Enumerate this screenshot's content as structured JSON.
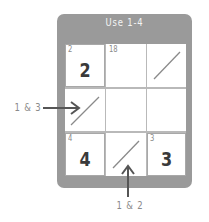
{
  "puzzle": {
    "title": "Use 1-4",
    "cells": [
      {
        "row": 0,
        "col": 0,
        "cage_label": "2",
        "value": "2",
        "slash": false
      },
      {
        "row": 0,
        "col": 1,
        "cage_label": "18",
        "value": "",
        "slash": false
      },
      {
        "row": 0,
        "col": 2,
        "cage_label": "",
        "value": "",
        "slash": true
      },
      {
        "row": 1,
        "col": 0,
        "cage_label": "",
        "value": "",
        "slash": true
      },
      {
        "row": 1,
        "col": 1,
        "cage_label": "",
        "value": "",
        "slash": false
      },
      {
        "row": 1,
        "col": 2,
        "cage_label": "",
        "value": "",
        "slash": false
      },
      {
        "row": 2,
        "col": 0,
        "cage_label": "4",
        "value": "4",
        "slash": false
      },
      {
        "row": 2,
        "col": 1,
        "cage_label": "",
        "value": "",
        "slash": true
      },
      {
        "row": 2,
        "col": 2,
        "cage_label": "3",
        "value": "3",
        "slash": false
      }
    ]
  },
  "annotations": {
    "left_callout": "1 & 3",
    "bottom_callout": "1 & 2"
  },
  "colors": {
    "frame": "#9a9a9a",
    "grid_line": "#b9b9b9",
    "text_dark": "#3a3a3a",
    "text_light": "#8a8a8a",
    "arrow": "#555555"
  }
}
